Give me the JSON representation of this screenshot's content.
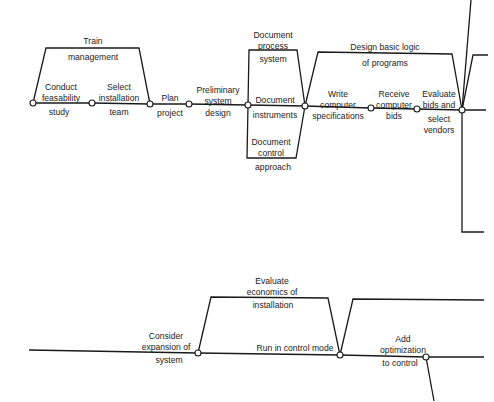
{
  "diagram": {
    "type": "activity-network",
    "line_color": "#1a1a1a",
    "node_fill": "#ffffff",
    "top_network": {
      "activities": [
        {
          "id": "train",
          "label_top": "Train",
          "label_bottom": "management"
        },
        {
          "id": "feasibility",
          "label_top": "Conduct\nfeasability",
          "label_bottom": "study"
        },
        {
          "id": "select_team",
          "label_top": "Select\ninstallation",
          "label_bottom": "team"
        },
        {
          "id": "plan",
          "label_top": "Plan",
          "label_bottom": "project"
        },
        {
          "id": "prelim",
          "label_top": "Preliminary\nsystem",
          "label_bottom": "design"
        },
        {
          "id": "doc_process",
          "label_top": "Document\nprocess",
          "label_bottom": "system"
        },
        {
          "id": "doc_instr",
          "label_top": "Document",
          "label_bottom": "instruments"
        },
        {
          "id": "doc_control",
          "label_top": "Document\ncontrol",
          "label_bottom": "approach"
        },
        {
          "id": "design_logic",
          "label_top": "Design basic logic",
          "label_bottom": "of programs"
        },
        {
          "id": "write_spec",
          "label_top": "Write\ncomputer",
          "label_bottom": "specifications"
        },
        {
          "id": "receive_bids",
          "label_top": "Receive\ncomputer",
          "label_bottom": "bids"
        },
        {
          "id": "evaluate_bids",
          "label_top": "Evaluate\nbids and",
          "label_bottom": "select\nvendors"
        }
      ]
    },
    "bottom_network": {
      "activities": [
        {
          "id": "consider_exp",
          "label_top": "Consider\nexpansion of",
          "label_bottom": "system"
        },
        {
          "id": "eval_econ",
          "label_top": "Evaluate\neconomics of",
          "label_bottom": "installation"
        },
        {
          "id": "run_control",
          "label_top": "Run in control mode",
          "label_bottom": ""
        },
        {
          "id": "add_opt",
          "label_top": "Add\noptimization",
          "label_bottom": "to control"
        }
      ]
    }
  }
}
